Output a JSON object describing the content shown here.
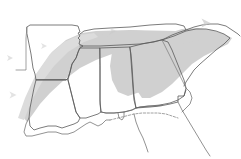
{
  "figure": {
    "width": 241,
    "height": 159,
    "background_color": "#ffffff"
  },
  "colors": {
    "background": "#ffffff",
    "shaded_region_fill": "#d0d0d0",
    "shaded_region_fill_light": "#dcdcdc",
    "state_border": "#5a5a5a",
    "state_border_soft": "#7a7a7a",
    "coastline": "#6e6e6e",
    "marker_fill": "#c8c8c8"
  },
  "shaded_region": {
    "label": "shaded-highlight-band",
    "description": "Diagonal gray band sweeping from lower-left to upper-right across the region",
    "opacity": 0.9
  },
  "states": [
    {
      "id": "arkansas",
      "label": "Arkansas"
    },
    {
      "id": "louisiana",
      "label": "Louisiana"
    },
    {
      "id": "mississippi",
      "label": "Mississippi"
    },
    {
      "id": "alabama",
      "label": "Alabama"
    },
    {
      "id": "tennessee",
      "label": "Tennessee"
    },
    {
      "id": "georgia",
      "label": "Georgia"
    },
    {
      "id": "south-carolina",
      "label": "South Carolina"
    },
    {
      "id": "north-carolina",
      "label": "North Carolina"
    },
    {
      "id": "florida",
      "label": "Florida"
    }
  ],
  "markers": [
    {
      "id": "marker-1",
      "icon": "triangle-marker-icon",
      "x": 10,
      "y": 58,
      "size": 6,
      "rotation": 0,
      "opacity": 0.55
    },
    {
      "id": "marker-2",
      "icon": "triangle-marker-icon",
      "x": 44,
      "y": 46,
      "size": 6,
      "rotation": 0,
      "opacity": 0.5
    },
    {
      "id": "marker-3",
      "icon": "triangle-marker-icon",
      "x": 113,
      "y": 31,
      "size": 7,
      "rotation": 0,
      "opacity": 0.45
    },
    {
      "id": "marker-4",
      "icon": "triangle-marker-icon",
      "x": 206,
      "y": 23,
      "size": 9,
      "rotation": 0,
      "opacity": 0.7
    },
    {
      "id": "marker-5",
      "icon": "triangle-marker-icon",
      "x": 13,
      "y": 95,
      "size": 7,
      "rotation": 0,
      "opacity": 0.5
    }
  ],
  "chart_data": {
    "type": "map",
    "region": "Southeastern United States",
    "features": [
      "state boundaries",
      "gulf coastline",
      "atlantic coastline",
      "shaded diagonal highlight band",
      "triangular point markers"
    ],
    "legend": [],
    "annotations": []
  }
}
